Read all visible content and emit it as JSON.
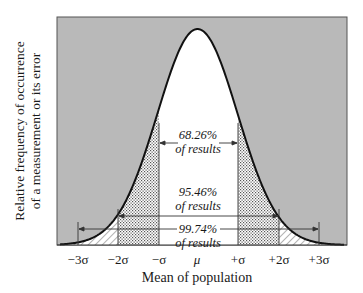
{
  "chart_data": {
    "type": "area",
    "title": "",
    "xlabel": "Mean of population",
    "ylabel": [
      "Relative frequency of occurrence",
      "of a measurement or its error"
    ],
    "x_ticks": [
      "−3σ",
      "−2σ",
      "−σ",
      "μ",
      "+σ",
      "+2σ",
      "+3σ"
    ],
    "x_tick_values": [
      -3,
      -2,
      -1,
      0,
      1,
      2,
      3
    ],
    "xlim": [
      -3.5,
      3.7
    ],
    "curve": "normal distribution (Gaussian) centered at μ",
    "regions": [
      {
        "range": [
          -1,
          1
        ],
        "fill": "white",
        "percent": "68.26%",
        "label": "of results"
      },
      {
        "range": [
          -2,
          2
        ],
        "fill": "dotted",
        "percent": "95.46%",
        "label": "of results"
      },
      {
        "range": [
          -3,
          3
        ],
        "fill": "hatched",
        "percent": "99.74%",
        "label": "of results"
      }
    ],
    "background_fill": "gray",
    "grid": false,
    "legend": "none"
  },
  "labels": {
    "ylabel_line1": "Relative frequency of occurrence",
    "ylabel_line2": "of a measurement or its error",
    "xlabel": "Mean of population",
    "ticks": [
      "−3σ",
      "−2σ",
      "−σ",
      "μ",
      "+σ",
      "+2σ",
      "+3σ"
    ],
    "ann1_pct": "68.26%",
    "ann1_txt": "of results",
    "ann2_pct": "95.46%",
    "ann2_txt": "of results",
    "ann3_pct": "99.74%",
    "ann3_txt": "of results"
  },
  "colors": {
    "background": "#b9b9b9",
    "curve": "#111111",
    "frame": "#555555"
  }
}
